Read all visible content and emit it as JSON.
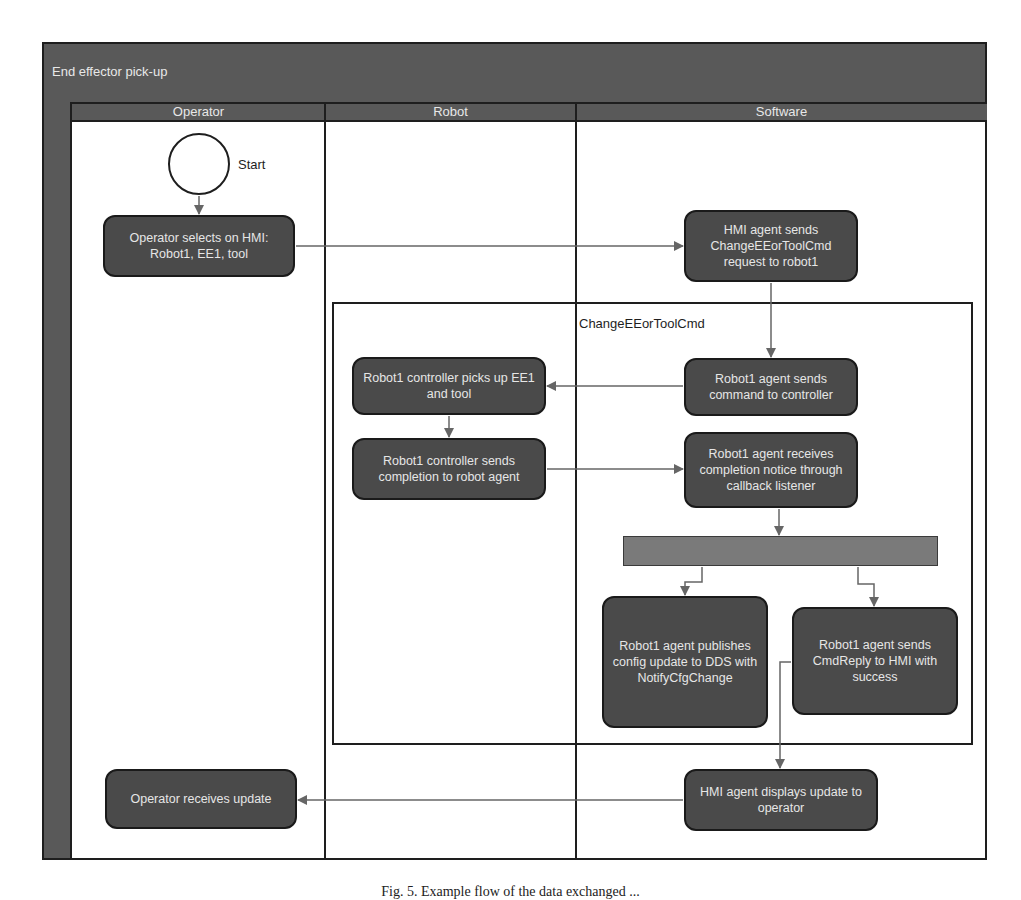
{
  "diagram": {
    "title": "End effector pick-up",
    "lanes": [
      {
        "id": "operator",
        "label": "Operator"
      },
      {
        "id": "robot",
        "label": "Robot"
      },
      {
        "id": "software",
        "label": "Software"
      }
    ],
    "start_label": "Start",
    "frame_label": "ChangeEEorToolCmd",
    "nodes": {
      "operator_selects": "Operator selects on HMI: Robot1, EE1, tool",
      "hmi_sends": "HMI agent sends ChangeEEorToolCmd request to robot1",
      "robot1_agent_sends": "Robot1 agent sends command to controller",
      "controller_picks": "Robot1 controller picks up EE1 and tool",
      "controller_sends": "Robot1 controller sends completion to robot agent",
      "agent_receives": "Robot1 agent receives completion notice through callback listener",
      "agent_publishes": "Robot1 agent publishes config update to DDS with NotifyCfgChange",
      "agent_cmdreply": "Robot1 agent sends CmdReply to HMI with success",
      "hmi_displays": "HMI agent displays update to operator",
      "operator_receives": "Operator receives update"
    },
    "edges": [
      [
        "start",
        "operator_selects"
      ],
      [
        "operator_selects",
        "hmi_sends"
      ],
      [
        "hmi_sends",
        "robot1_agent_sends"
      ],
      [
        "robot1_agent_sends",
        "controller_picks"
      ],
      [
        "controller_picks",
        "controller_sends"
      ],
      [
        "controller_sends",
        "agent_receives"
      ],
      [
        "agent_receives",
        "fork"
      ],
      [
        "fork",
        "agent_publishes"
      ],
      [
        "fork",
        "agent_cmdreply"
      ],
      [
        "agent_cmdreply",
        "hmi_displays"
      ],
      [
        "hmi_displays",
        "operator_receives"
      ]
    ],
    "colors": {
      "node_fill": "#4a4a4a",
      "header_fill": "#595959",
      "fork_fill": "#7a7a7a",
      "arrow": "#666666",
      "border": "#1e1e1e"
    }
  },
  "caption": {
    "text": "Fig. 5. Example flow of the data exchanged ..."
  }
}
